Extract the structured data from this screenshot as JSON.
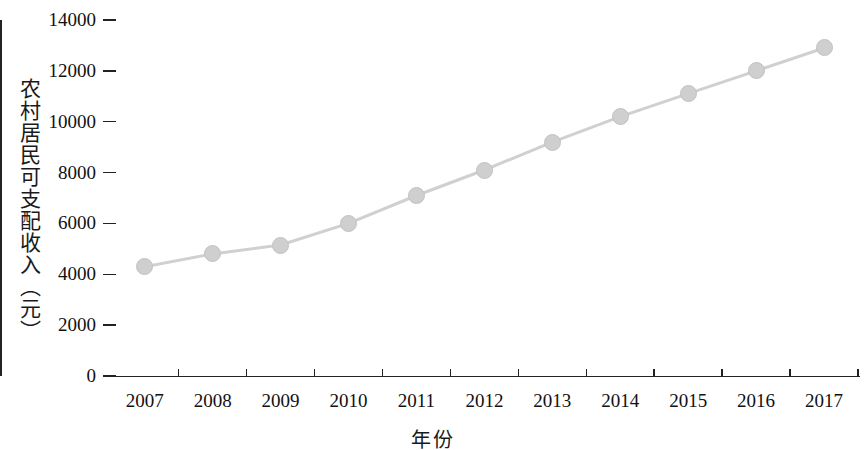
{
  "chart_data": {
    "type": "line",
    "title": "",
    "subtitle": "",
    "xlabel": "年份",
    "ylabel": "农村居民可支配收入（元）",
    "categories": [
      "2007",
      "2008",
      "2009",
      "2010",
      "2011",
      "2012",
      "2013",
      "2014",
      "2015",
      "2016",
      "2017"
    ],
    "x": [
      2007,
      2008,
      2009,
      2010,
      2011,
      2012,
      2013,
      2014,
      2015,
      2016,
      2017
    ],
    "values": [
      4300,
      4800,
      5150,
      6000,
      7100,
      8100,
      9200,
      10200,
      11100,
      12000,
      12900
    ],
    "series": [
      {
        "name": "农村居民可支配收入",
        "values": [
          4300,
          4800,
          5150,
          6000,
          7100,
          8100,
          9200,
          10200,
          11100,
          12000,
          12900
        ]
      }
    ],
    "ylim": [
      0,
      14000
    ],
    "ytick_labels": [
      "0",
      "2000",
      "4000",
      "6000",
      "8000",
      "10000",
      "12000",
      "14000"
    ],
    "yticks": [
      0,
      2000,
      4000,
      6000,
      8000,
      10000,
      12000,
      14000
    ],
    "grid": false,
    "legend": null,
    "legend_position": "none",
    "marker": "circle",
    "line_color": "#d0d0d0",
    "marker_color": "#cfcfcf",
    "axis_color": "#222222"
  },
  "axis": {
    "y_title": "农村居民可支配收入（元）",
    "x_title": "年份"
  }
}
